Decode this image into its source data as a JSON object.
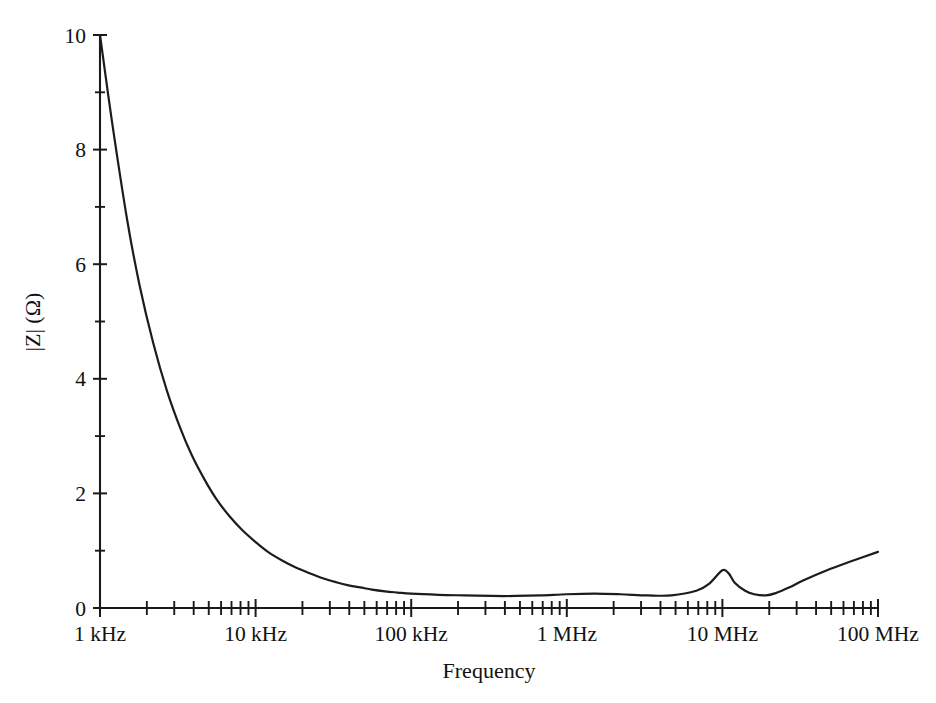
{
  "chart_data": {
    "type": "line",
    "title": "",
    "subtitle": "",
    "xlabel": "Frequency",
    "ylabel": "|Z| (Ω)",
    "xscale": "log",
    "yscale": "linear",
    "xlim": [
      1000,
      100000000
    ],
    "ylim": [
      0,
      10
    ],
    "grid": false,
    "legend": null,
    "series_color": "#1c1c1c",
    "x_tick_labels": [
      "1 kHz",
      "10 kHz",
      "100 kHz",
      "1 MHz",
      "10 MHz",
      "100 MHz"
    ],
    "x_tick_values": [
      1000,
      10000,
      100000,
      1000000,
      10000000,
      100000000
    ],
    "y_tick_labels": [
      "0",
      "2",
      "4",
      "6",
      "8",
      "10"
    ],
    "y_tick_values": [
      0,
      2,
      4,
      6,
      8,
      10
    ],
    "y_minor_ticks": [
      1,
      3,
      5,
      7,
      9
    ],
    "x_minor_decade_multipliers": [
      2,
      3,
      4,
      5,
      6,
      7,
      8,
      9
    ],
    "series": [
      {
        "name": "|Z|",
        "x": [
          1000,
          1200,
          1500,
          1800,
          2200,
          2700,
          3300,
          3900,
          4700,
          5600,
          6800,
          8200,
          10000,
          12000,
          15000,
          18000,
          22000,
          27000,
          33000,
          39000,
          47000,
          56000,
          68000,
          82000,
          100000,
          150000,
          220000,
          330000,
          470000,
          680000,
          1000000,
          1500000,
          2200000,
          3300000,
          4700000,
          6800000,
          8200000,
          10000000,
          11000000,
          12000000,
          14000000,
          16000000,
          19000000,
          22000000,
          27000000,
          33000000,
          47000000,
          68000000,
          100000000
        ],
        "y": [
          10.0,
          8.45,
          6.75,
          5.62,
          4.62,
          3.78,
          3.12,
          2.66,
          2.24,
          1.9,
          1.6,
          1.36,
          1.15,
          0.98,
          0.82,
          0.71,
          0.61,
          0.52,
          0.45,
          0.4,
          0.36,
          0.32,
          0.29,
          0.27,
          0.25,
          0.23,
          0.22,
          0.21,
          0.21,
          0.22,
          0.24,
          0.25,
          0.24,
          0.22,
          0.22,
          0.3,
          0.42,
          0.66,
          0.6,
          0.44,
          0.3,
          0.24,
          0.22,
          0.26,
          0.36,
          0.48,
          0.66,
          0.82,
          0.98
        ]
      }
    ],
    "annotations": [
      {
        "label": "high-impedance low-frequency rolloff",
        "x": 1000,
        "y": 10.0
      },
      {
        "label": "broad minimum",
        "x": 400000,
        "y": 0.21
      },
      {
        "label": "resonance peak",
        "x": 10000000,
        "y": 0.66
      },
      {
        "label": "post-resonance minimum",
        "x": 19000000,
        "y": 0.22
      },
      {
        "label": "inductive rise",
        "x": 100000000,
        "y": 0.98
      }
    ]
  },
  "axes": {
    "x_title": "Frequency",
    "y_title": "|Z| (Ω)"
  },
  "ticks": {
    "x": [
      {
        "label": "1 kHz"
      },
      {
        "label": "10 kHz"
      },
      {
        "label": "100 kHz"
      },
      {
        "label": "1 MHz"
      },
      {
        "label": "10 MHz"
      },
      {
        "label": "100 MHz"
      }
    ],
    "y": [
      {
        "label": "0"
      },
      {
        "label": "2"
      },
      {
        "label": "4"
      },
      {
        "label": "6"
      },
      {
        "label": "8"
      },
      {
        "label": "10"
      }
    ]
  }
}
